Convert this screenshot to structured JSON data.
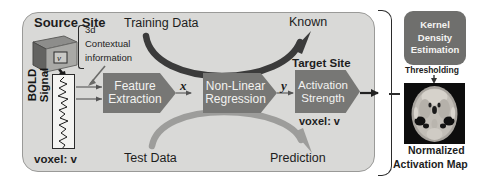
{
  "diagram": {
    "title_region": "fMRI activation prediction pipeline",
    "source_site_label": "Source Site",
    "target_site_label": "Target Site",
    "training_data_label": "Training Data",
    "test_data_label": "Test Data",
    "known_label": "Known",
    "prediction_label": "Prediction",
    "contextual_info": {
      "line1": "3d",
      "line2": "Contextual",
      "line3": "information"
    },
    "cube_voxel_letter": "v",
    "bold_signal_label": "BOLD Signal",
    "voxel_left_label": "voxel: v",
    "voxel_right_label": "voxel: v",
    "variable_x": "x",
    "variable_y": "y",
    "process_boxes": [
      {
        "name": "feature-extraction",
        "line1": "Feature",
        "line2": "Extraction"
      },
      {
        "name": "non-linear-regression",
        "line1": "Non-Linear",
        "line2": "Regression"
      },
      {
        "name": "activation-strength",
        "line1": "Activation",
        "line2": "Strength"
      }
    ],
    "right_panel": {
      "kde_line1": "Kernel",
      "kde_line2": "Density",
      "kde_line3": "Estimation",
      "thresholding_label": "Thresholding",
      "map_line1": "Normalized",
      "map_line2": "Activation Map"
    },
    "colors": {
      "panel_fill": "#d9d9d7",
      "panel_border": "#9a9a98",
      "process_fill": "#777775",
      "process_text": "#f2f2f0",
      "kde_fill": "#6f6f6d",
      "dark_arrow": "#3b3b3b",
      "light_arrow": "#9d9d9b",
      "text": "#1d1d1d",
      "brain_bg": "#0d0d0d"
    }
  }
}
